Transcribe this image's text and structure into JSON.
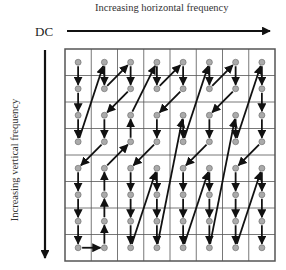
{
  "labels": {
    "horizontal_axis": "Increasing horizontal frequency",
    "vertical_axis": "Increasing vertical frequency",
    "origin": "DC"
  },
  "grid": {
    "rows": 8,
    "cols": 8,
    "left": 65,
    "top": 49,
    "right": 275,
    "bottom": 261,
    "line_color": "#555555",
    "dot_fill": "#aaaaaa",
    "arrow_color": "#111111"
  },
  "scan_path": [
    [
      0,
      0
    ],
    [
      0,
      1
    ],
    [
      0,
      2
    ],
    [
      0,
      3
    ],
    [
      1,
      0
    ],
    [
      1,
      1
    ],
    [
      2,
      0
    ],
    [
      2,
      1
    ],
    [
      1,
      2
    ],
    [
      1,
      3
    ],
    [
      0,
      4
    ],
    [
      0,
      5
    ],
    [
      0,
      6
    ],
    [
      0,
      7
    ],
    [
      1,
      7
    ],
    [
      1,
      6
    ],
    [
      1,
      5
    ],
    [
      1,
      4
    ],
    [
      2,
      3
    ],
    [
      2,
      2
    ],
    [
      3,
      0
    ],
    [
      3,
      1
    ],
    [
      4,
      0
    ],
    [
      4,
      1
    ],
    [
      3,
      2
    ],
    [
      3,
      3
    ],
    [
      2,
      4
    ],
    [
      2,
      5
    ],
    [
      2,
      6
    ],
    [
      2,
      7
    ],
    [
      3,
      4
    ],
    [
      3,
      5
    ],
    [
      3,
      6
    ],
    [
      3,
      7
    ],
    [
      4,
      2
    ],
    [
      4,
      3
    ],
    [
      5,
      0
    ],
    [
      5,
      1
    ],
    [
      6,
      0
    ],
    [
      6,
      1
    ],
    [
      5,
      2
    ],
    [
      5,
      3
    ],
    [
      4,
      4
    ],
    [
      4,
      5
    ],
    [
      4,
      6
    ],
    [
      4,
      7
    ],
    [
      5,
      4
    ],
    [
      5,
      5
    ],
    [
      5,
      6
    ],
    [
      5,
      7
    ],
    [
      6,
      2
    ],
    [
      6,
      3
    ],
    [
      7,
      0
    ],
    [
      7,
      1
    ],
    [
      7,
      2
    ],
    [
      7,
      3
    ],
    [
      6,
      4
    ],
    [
      6,
      5
    ],
    [
      6,
      6
    ],
    [
      6,
      7
    ],
    [
      7,
      4
    ],
    [
      7,
      5
    ],
    [
      7,
      6
    ],
    [
      7,
      7
    ]
  ]
}
